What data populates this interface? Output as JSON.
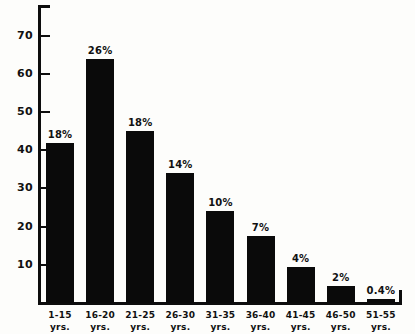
{
  "chart_data": {
    "type": "bar",
    "title": "",
    "xlabel": "",
    "ylabel": "",
    "ylim": [
      0,
      78
    ],
    "grid": false,
    "legend": null,
    "categories": [
      "1-15 yrs.",
      "16-20 yrs.",
      "21-25 yrs.",
      "26-30 yrs.",
      "31-35 yrs.",
      "36-40 yrs.",
      "41-45 yrs.",
      "46-50 yrs.",
      "51-55 yrs."
    ],
    "category_lines": [
      {
        "range": "1-15",
        "unit": "yrs."
      },
      {
        "range": "16-20",
        "unit": "yrs."
      },
      {
        "range": "21-25",
        "unit": "yrs."
      },
      {
        "range": "26-30",
        "unit": "yrs."
      },
      {
        "range": "31-35",
        "unit": "yrs."
      },
      {
        "range": "36-40",
        "unit": "yrs."
      },
      {
        "range": "41-45",
        "unit": "yrs."
      },
      {
        "range": "46-50",
        "unit": "yrs."
      },
      {
        "range": "51-55",
        "unit": "yrs."
      }
    ],
    "values": [
      42,
      64,
      45,
      34,
      24,
      17.5,
      9.5,
      4.5,
      1
    ],
    "data_labels": [
      "18%",
      "26%",
      "18%",
      "14%",
      "10%",
      "7%",
      "4%",
      "2%",
      "0.4%"
    ],
    "y_ticks": [
      10,
      20,
      30,
      40,
      50,
      60,
      70
    ],
    "y_tick_labels": [
      "10",
      "20",
      "30",
      "40",
      "50",
      "60",
      "70"
    ],
    "bar_color": "#0a0a0a",
    "axis_color": "#0d0d0d",
    "background_color": "#fdfdfb"
  },
  "figure": {
    "title_remnant": "",
    "axis_name": "chart-axes"
  }
}
